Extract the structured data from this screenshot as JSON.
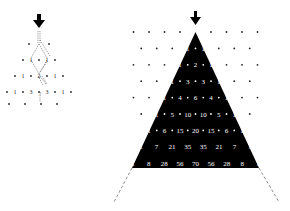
{
  "left_diagram": {
    "description": "small lattice with paths and arrow",
    "arrow": "down-arrow",
    "rows": [
      [],
      [
        "1",
        "1"
      ],
      [
        "1",
        "2",
        "1"
      ],
      [
        "1",
        "3",
        "3",
        "1"
      ],
      []
    ],
    "path_label": "?"
  },
  "right_diagram": {
    "description": "Pascal's triangle in black triangle over dot lattice",
    "arrow": "down-arrow",
    "rows": [
      [
        "1",
        "1"
      ],
      [
        "1",
        "2",
        "1"
      ],
      [
        "1",
        "3",
        "3",
        "1"
      ],
      [
        "1",
        "4",
        "6",
        "4",
        "1"
      ],
      [
        "1",
        "5",
        "10",
        "10",
        "5",
        "1"
      ],
      [
        "1",
        "6",
        "15",
        "20",
        "15",
        "6",
        "1"
      ],
      [
        "1",
        "7",
        "21",
        "35",
        "35",
        "21",
        "7",
        "1"
      ],
      [
        "1",
        "8",
        "28",
        "56",
        "70",
        "56",
        "28",
        "8",
        "1"
      ]
    ],
    "colors": {
      "triangle": "#000000",
      "text": "#ffffff",
      "dots": "#222222"
    }
  }
}
